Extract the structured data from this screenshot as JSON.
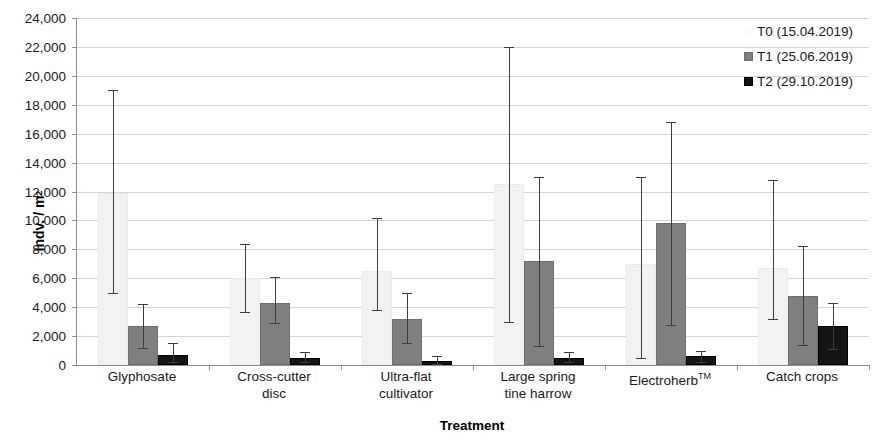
{
  "chart_data": {
    "type": "bar",
    "title": "",
    "xlabel": "Treatment",
    "ylabel": "Indv. / m2",
    "ylabel_html": "Indv. / m<sup>2</sup>",
    "ylim": [
      0,
      24000
    ],
    "ytick_step": 2000,
    "grid": true,
    "legend_position": "top-right",
    "ytick_labels": [
      "0",
      "2,000",
      "4,000",
      "6,000",
      "8,000",
      "10,000",
      "12,000",
      "14,000",
      "16,000",
      "18,000",
      "20,000",
      "22,000",
      "24,000"
    ],
    "ytick_values": [
      0,
      2000,
      4000,
      6000,
      8000,
      10000,
      12000,
      14000,
      16000,
      18000,
      20000,
      22000,
      24000
    ],
    "categories": [
      "Glyphosate",
      "Cross-cutter disc",
      "Ultra-flat cultivator",
      "Large spring tine harrow",
      "Electroherb™",
      "Catch crops"
    ],
    "category_lines": [
      [
        "Glyphosate"
      ],
      [
        "Cross-cutter",
        "disc"
      ],
      [
        "Ultra-flat",
        "cultivator"
      ],
      [
        "Large spring",
        "tine harrow"
      ],
      [
        "Electroherb",
        "TM"
      ],
      [
        "Catch crops"
      ]
    ],
    "series": [
      {
        "name": "T0 (15.04.2019)",
        "key": "t0",
        "color": "#f2f2f2",
        "values": [
          11900,
          6000,
          6500,
          12500,
          7000,
          6700
        ],
        "err_low": [
          5000,
          3700,
          3800,
          3000,
          500,
          3200
        ],
        "err_high": [
          19000,
          8400,
          10200,
          22000,
          13000,
          12800
        ]
      },
      {
        "name": "T1 (25.06.2019)",
        "key": "t1",
        "color": "#7f7f7f",
        "values": [
          2700,
          4300,
          3200,
          7200,
          9800,
          4800
        ],
        "err_low": [
          1200,
          2900,
          1500,
          1300,
          2800,
          1400
        ],
        "err_high": [
          4200,
          6100,
          5000,
          13000,
          16800,
          8200
        ]
      },
      {
        "name": "T2 (29.10.2019)",
        "key": "t2",
        "color": "#141414",
        "values": [
          700,
          500,
          300,
          500,
          600,
          2700
        ],
        "err_low": [
          200,
          200,
          100,
          200,
          200,
          1100
        ],
        "err_high": [
          1500,
          900,
          600,
          900,
          1000,
          4300
        ]
      }
    ]
  },
  "legend": {
    "items": [
      {
        "label": "T0 (15.04.2019)",
        "key": "t0"
      },
      {
        "label": "T1 (25.06.2019)",
        "key": "t1"
      },
      {
        "label": "T2 (29.10.2019)",
        "key": "t2"
      }
    ]
  },
  "axes": {
    "x_title": "Treatment",
    "y_title": "Indv. / m"
  }
}
